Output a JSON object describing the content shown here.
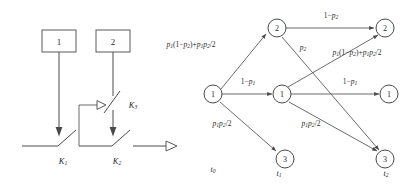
{
  "figure": {
    "panels": [
      {
        "id": "circuit",
        "name": "switch-circuit-diagram",
        "boxes": [
          {
            "label": "1",
            "x": 42,
            "y": 30,
            "w": 34,
            "h": 22
          },
          {
            "label": "2",
            "x": 96,
            "y": 30,
            "w": 34,
            "h": 22
          }
        ],
        "switches": [
          {
            "label": "K",
            "sub": "1"
          },
          {
            "label": "K",
            "sub": "2"
          },
          {
            "label": "K",
            "sub": "3"
          }
        ],
        "output_arrow": "rightward-open-arrow"
      },
      {
        "id": "trellis",
        "name": "state-transition-trellis",
        "time_labels": [
          {
            "label": "t",
            "sub": "0",
            "x": 213,
            "y": 172
          },
          {
            "label": "t",
            "sub": "1",
            "x": 279,
            "y": 172
          },
          {
            "label": "t",
            "sub": "2",
            "x": 386,
            "y": 172
          }
        ],
        "nodes": [
          {
            "id": "n0_1",
            "state": "1",
            "cx": 213,
            "cy": 94,
            "column": 0
          },
          {
            "id": "n1_2",
            "state": "2",
            "cx": 277,
            "cy": 28,
            "column": 1
          },
          {
            "id": "n1_1",
            "state": "1",
            "cx": 282,
            "cy": 94,
            "column": 1
          },
          {
            "id": "n1_3",
            "state": "3",
            "cx": 285,
            "cy": 159,
            "column": 1
          },
          {
            "id": "n2_2",
            "state": "2",
            "cx": 385,
            "cy": 28,
            "column": 2
          },
          {
            "id": "n2_1",
            "state": "1",
            "cx": 389,
            "cy": 94,
            "column": 2
          },
          {
            "id": "n2_3",
            "state": "3",
            "cx": 385,
            "cy": 159,
            "column": 2
          }
        ],
        "edge_labels": [
          {
            "id": "e_up_left",
            "text": "p1(1-p2)+p1p2/2",
            "x": 191,
            "y": 47
          },
          {
            "id": "e_mid_left",
            "text": "1-p1",
            "x": 248,
            "y": 84
          },
          {
            "id": "e_down_left",
            "text": "p1p2/2",
            "x": 222,
            "y": 126
          },
          {
            "id": "e_top",
            "text": "1-p2",
            "x": 331,
            "y": 18
          },
          {
            "id": "e_p2",
            "text": "p2",
            "x": 303,
            "y": 50
          },
          {
            "id": "e_up_right",
            "text": "p1(1-p2)+p1p2/2",
            "x": 357,
            "y": 55
          },
          {
            "id": "e_mid_right",
            "text": "1-p1",
            "x": 350,
            "y": 84
          },
          {
            "id": "e_down_right",
            "text": "p1p2/2",
            "x": 311,
            "y": 126
          }
        ]
      }
    ]
  },
  "labels": {
    "box_1": "1",
    "box_2": "2",
    "K": "K",
    "k1_sub": "1",
    "k2_sub": "2",
    "k3_sub": "3",
    "state_1": "1",
    "state_2": "2",
    "state_3": "3",
    "t": "t",
    "t0_sub": "0",
    "t1_sub": "1",
    "t2_sub": "2",
    "one_minus": "1−",
    "p": "p",
    "p_sub1": "1",
    "p_sub2": "2",
    "slash2": "/2",
    "plus": "+",
    "lparen": "(",
    "rparen": ")"
  },
  "colors": {
    "stroke": "#4a4a4a",
    "stroke_light": "#5a5a5a",
    "text": "#2a2a2a",
    "background": "#ffffff"
  }
}
